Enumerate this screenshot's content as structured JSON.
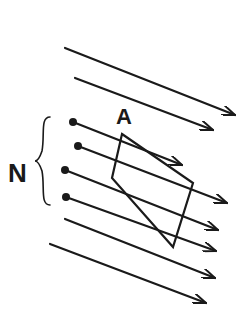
{
  "diagram": {
    "labels": {
      "area": "A",
      "count": "N"
    },
    "colors": {
      "ink": "#1a1a1a",
      "background": "#ffffff"
    },
    "field_lines": [
      {
        "id": 1,
        "x1": 65,
        "y1": 48,
        "x2": 235,
        "y2": 115,
        "dot": false
      },
      {
        "id": 2,
        "x1": 75,
        "y1": 78,
        "x2": 213,
        "y2": 130,
        "dot": false
      },
      {
        "id": 3,
        "x1": 73,
        "y1": 122,
        "x2": 182,
        "y2": 165,
        "dot": true
      },
      {
        "id": 4,
        "x1": 78,
        "y1": 146,
        "x2": 227,
        "y2": 203,
        "dot": true
      },
      {
        "id": 5,
        "x1": 65,
        "y1": 170,
        "x2": 218,
        "y2": 230,
        "dot": true
      },
      {
        "id": 6,
        "x1": 66,
        "y1": 197,
        "x2": 216,
        "y2": 251,
        "dot": true
      },
      {
        "id": 7,
        "x1": 65,
        "y1": 219,
        "x2": 215,
        "y2": 278,
        "dot": false
      },
      {
        "id": 8,
        "x1": 50,
        "y1": 244,
        "x2": 206,
        "y2": 303,
        "dot": false
      }
    ],
    "area_polygon": [
      [
        122,
        134
      ],
      [
        193,
        183
      ],
      [
        173,
        247
      ],
      [
        112,
        178
      ]
    ],
    "brace": {
      "x": 42,
      "y_top": 117,
      "y_bottom": 205,
      "y_mid": 161
    }
  }
}
